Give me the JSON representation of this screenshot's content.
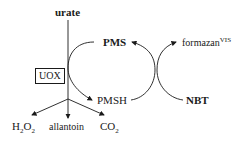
{
  "diagram": {
    "substrate": "urate",
    "enzyme": "UOX",
    "products": {
      "h2o2": {
        "base": "H",
        "sub1": "2",
        "mid": "O",
        "sub2": "2"
      },
      "allantoin": "allantoin",
      "co2": {
        "base": "CO",
        "sub": "2"
      }
    },
    "mediator_oxidized": "PMS",
    "mediator_reduced": "PMSH",
    "dye_reactant": "NBT",
    "dye_product": {
      "base": "formazan",
      "sup": "VIS"
    }
  }
}
